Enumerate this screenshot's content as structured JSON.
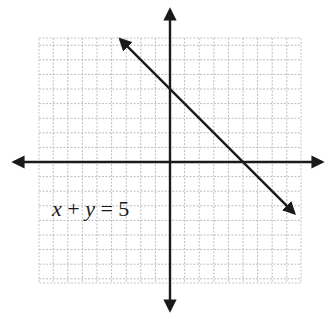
{
  "chart_data": {
    "type": "line",
    "title": "",
    "equation": "x + y = 5",
    "xlabel": "",
    "ylabel": "",
    "xlim": [
      -9,
      9
    ],
    "ylim": [
      -8,
      9
    ],
    "grid": true,
    "grid_step": 1,
    "axis_ticks_labeled": false,
    "series": [
      {
        "name": "x + y = 5",
        "x": [
          -3.4,
          8.5
        ],
        "y": [
          8.4,
          -3.5
        ],
        "intercepts": {
          "x_intercept": [
            5,
            0
          ],
          "y_intercept": [
            0,
            5
          ]
        },
        "arrows_both_ends": true
      }
    ],
    "axes_arrows": true
  },
  "label": {
    "equation_text_x": "x",
    "equation_text_plus": " + ",
    "equation_text_y": "y",
    "equation_text_rest": " = 5"
  },
  "colors": {
    "axis": "#1a1a1a",
    "line": "#1a1a1a",
    "grid": "#b8b8b8",
    "background": "#ffffff"
  }
}
